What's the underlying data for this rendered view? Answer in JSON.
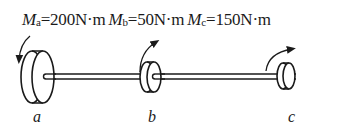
{
  "figure": {
    "moments": [
      {
        "symbol": "M",
        "sub": "a",
        "value": "=200N·m"
      },
      {
        "symbol": "M",
        "sub": "b",
        "value": "=50N·m"
      },
      {
        "symbol": "M",
        "sub": "c",
        "value": "=150N·m"
      }
    ],
    "points": [
      {
        "label": "a"
      },
      {
        "label": "b"
      },
      {
        "label": "c"
      }
    ]
  }
}
